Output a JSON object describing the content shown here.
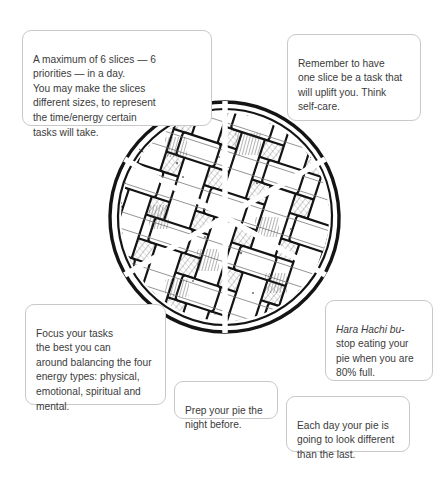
{
  "page": {
    "background_color": "#ffffff",
    "text_color": "#3b3b3b",
    "callout_border_color": "#c9c9c9"
  },
  "illustration": {
    "name": "lattice-crust-pie",
    "description": "Hand-drawn lattice top pie divided into 6 equal slices by white radial dividers",
    "slice_count": 6,
    "center": {
      "x": 225,
      "y": 217
    },
    "radius": 115,
    "ink_color": "#1a1a1a",
    "fill_color": "#ffffff",
    "divider_color": "#ffffff"
  },
  "callouts": {
    "slices": {
      "id": "max-slices-note",
      "text": "A maximum of 6 slices — 6\npriorities — in a day.\nYou may make the slices\ndifferent sizes, to represent\nthe time/energy certain\ntasks will take."
    },
    "uplift": {
      "id": "self-care-note",
      "text": "Remember to have\none slice be a task that\nwill uplift you. Think\nself-care."
    },
    "energy": {
      "id": "energy-types-note",
      "text": "Focus your tasks\nthe best you can\naround balancing the four\nenergy types: physical,\nemotional, spiritual and\nmental."
    },
    "hara": {
      "id": "hara-hachi-bu-note",
      "italic_lead": "Hara Hachi bu-",
      "text": "\nstop eating your\npie when you are\n80% full."
    },
    "prep": {
      "id": "prep-ahead-note",
      "text": "Prep your pie the\nnight before."
    },
    "eachday": {
      "id": "daily-variation-note",
      "text": "Each day your pie is\ngoing to look different\nthan the last."
    }
  }
}
